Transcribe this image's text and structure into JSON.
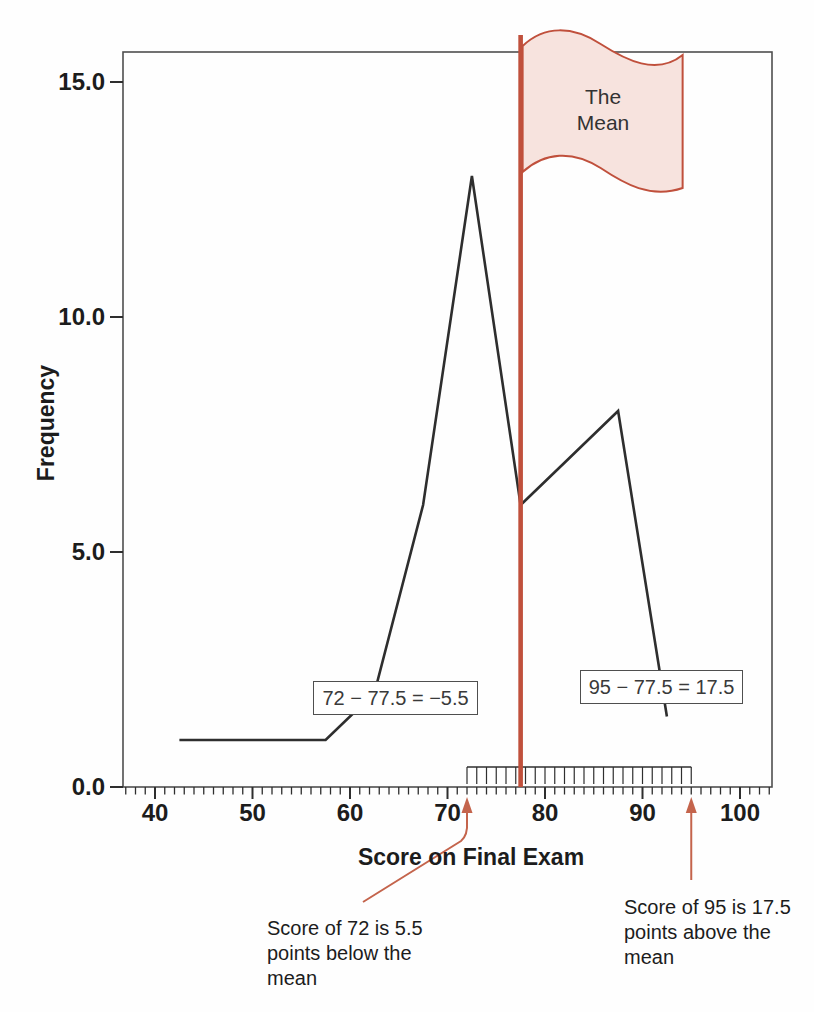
{
  "colors": {
    "accent": "#c0503c",
    "arrow": "#c4644c",
    "flag_fill": "#f7e3de",
    "ink": "#2e2e2e",
    "frame": "#4f4f4f",
    "text": "#1c1c1c",
    "box_text": "#3a3a3a",
    "bg": "#fefefe"
  },
  "figure": {
    "flag_label": "The\nMean",
    "y_axis_title": "Frequency",
    "x_axis_title": "Score on Final Exam",
    "box_left": "72 − 77.5 = −5.5",
    "box_right": "95 − 77.5 = 17.5",
    "note_left": "Score of 72 is 5.5\npoints below the\nmean",
    "note_right": "Score of 95 is 17.5\npoints above the\nmean"
  },
  "chart_data": {
    "type": "line",
    "xlabel": "Score on Final Exam",
    "ylabel": "Frequency",
    "xlim": [
      37,
      103.5
    ],
    "ylim": [
      0,
      15.6
    ],
    "grid": false,
    "x_ticks": [
      40,
      50,
      60,
      70,
      80,
      90,
      100
    ],
    "x_tick_labels": [
      "40",
      "50",
      "60",
      "70",
      "80",
      "90",
      "100"
    ],
    "x_minor_tick_range": [
      37,
      103
    ],
    "y_ticks": [
      0,
      5,
      10,
      15
    ],
    "y_tick_labels": [
      "0.0",
      "5.0",
      "10.0",
      "15.0"
    ],
    "series": [
      {
        "name": "frequency-polygon",
        "points": [
          [
            42.5,
            1
          ],
          [
            47.5,
            1
          ],
          [
            52.5,
            1
          ],
          [
            57.5,
            1
          ],
          [
            62.5,
            2
          ],
          [
            67.5,
            6
          ],
          [
            72.5,
            13
          ],
          [
            77.5,
            6
          ],
          [
            82.5,
            7
          ],
          [
            87.5,
            8
          ],
          [
            92.5,
            1.5
          ]
        ]
      }
    ],
    "mean": {
      "value": 77.5,
      "label": "The Mean"
    },
    "deviation_ruler": {
      "from": 72,
      "to": 95,
      "step": 1
    },
    "annotations": [
      {
        "text": "72 − 77.5 = −5.5",
        "score": 72,
        "deviation": -5.5
      },
      {
        "text": "95 − 77.5 = 17.5",
        "score": 95,
        "deviation": 17.5
      },
      {
        "text": "Score of 72 is 5.5 points below the mean",
        "arrow_at_score": 72
      },
      {
        "text": "Score of 95 is 17.5 points above the mean",
        "arrow_at_score": 95
      }
    ]
  }
}
